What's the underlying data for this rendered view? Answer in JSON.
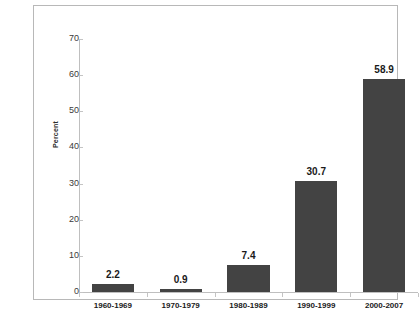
{
  "chart_data": {
    "type": "bar",
    "title": "",
    "xlabel": "",
    "ylabel": "Percent",
    "categories": [
      "1960-1969",
      "1970-1979",
      "1980-1989",
      "1990-1999",
      "2000-2007"
    ],
    "values": [
      2.2,
      0.9,
      7.4,
      30.7,
      58.9
    ],
    "value_labels": [
      "2.2",
      "0.9",
      "7.4",
      "30.7",
      "58.9"
    ],
    "ylim": [
      0,
      70
    ],
    "ytick_step": 10,
    "yticks": [
      0,
      10,
      20,
      30,
      40,
      50,
      60,
      70
    ],
    "ytick_labels": [
      "0",
      "10",
      "20",
      "30",
      "40",
      "50",
      "60",
      "70"
    ],
    "grid": false,
    "legend": false,
    "legend_position": "none",
    "bar_color": "#434343",
    "axis_color": "#bfbfbf",
    "frame_color": "#b8b8b8",
    "text_color": "#1a1a1a"
  }
}
